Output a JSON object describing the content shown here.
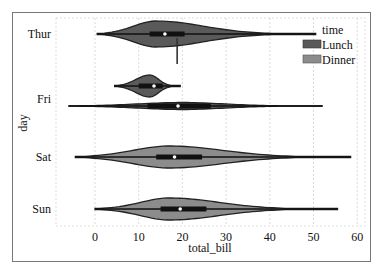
{
  "chart_data": {
    "type": "violin",
    "orientation": "horizontal",
    "title": "",
    "xlabel": "total_bill",
    "ylabel": "day",
    "xlim": [
      -8,
      62
    ],
    "xticks": [
      0,
      10,
      20,
      30,
      40,
      50,
      60
    ],
    "grid": "vertical dashed",
    "categories": [
      "Thur",
      "Fri",
      "Sat",
      "Sun"
    ],
    "legend": {
      "title": "time",
      "position": "upper right",
      "entries": [
        {
          "label": "Lunch",
          "color": "#5a5a5a"
        },
        {
          "label": "Dinner",
          "color": "#8c8c8c"
        }
      ]
    },
    "series": [
      {
        "name": "Lunch",
        "color": "#5a5a5a",
        "violins": [
          {
            "day": "Thur",
            "min": 0.5,
            "q1": 12.5,
            "median": 16.0,
            "q3": 20.5,
            "max": 50.5,
            "mode": 14.0
          },
          {
            "day": "Fri",
            "min": 4.5,
            "q1": 10.0,
            "median": 13.5,
            "q3": 15.5,
            "max": 19.5,
            "mode": 12.5
          }
        ]
      },
      {
        "name": "Dinner",
        "color": "#8c8c8c",
        "violins": [
          {
            "day": "Thur",
            "min": 18.8,
            "q1": 18.8,
            "median": 18.8,
            "q3": 18.8,
            "max": 18.8
          },
          {
            "day": "Fri",
            "min": -6.0,
            "q1": 12.0,
            "median": 19.0,
            "q3": 26.5,
            "max": 52.0,
            "mode": 20.0
          },
          {
            "day": "Sat",
            "min": -4.5,
            "q1": 14.0,
            "median": 18.2,
            "q3": 24.5,
            "max": 58.5,
            "mode": 17.0
          },
          {
            "day": "Sun",
            "min": 0.0,
            "q1": 15.0,
            "median": 19.5,
            "q3": 25.5,
            "max": 55.5,
            "mode": 17.0
          }
        ]
      }
    ]
  },
  "axes": {
    "x_label": "total_bill",
    "y_label": "day",
    "x_ticks": [
      "0",
      "10",
      "20",
      "30",
      "40",
      "50",
      "60"
    ],
    "y_ticks": [
      "Thur",
      "Fri",
      "Sat",
      "Sun"
    ]
  },
  "legend": {
    "title": "time",
    "items": [
      "Lunch",
      "Dinner"
    ]
  }
}
